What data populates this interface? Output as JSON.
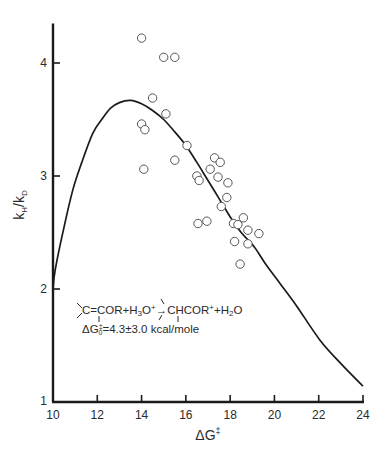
{
  "chart_data": {
    "type": "scatter",
    "title": "",
    "xlabel": "ΔG‡",
    "ylabel": "kH/kD",
    "xlim": [
      10,
      24
    ],
    "ylim": [
      1,
      4.35
    ],
    "x_ticks": [
      10,
      12,
      14,
      16,
      18,
      20,
      22,
      24
    ],
    "y_ticks": [
      1,
      2,
      3,
      4
    ],
    "grid": false,
    "legend": null,
    "annotation": {
      "line1": "C=COR+H3O+ → CHCOR+ + H2O",
      "line2": "ΔG0‡=4.3±3.0 kcal/mole"
    },
    "series": [
      {
        "name": "observed",
        "kind": "scatter",
        "marker": "open-circle",
        "points": [
          [
            14.0,
            4.22
          ],
          [
            15.0,
            4.05
          ],
          [
            15.5,
            4.05
          ],
          [
            14.5,
            3.69
          ],
          [
            15.1,
            3.55
          ],
          [
            14.0,
            3.46
          ],
          [
            14.15,
            3.41
          ],
          [
            16.05,
            3.27
          ],
          [
            15.5,
            3.14
          ],
          [
            14.1,
            3.06
          ],
          [
            17.3,
            3.16
          ],
          [
            17.55,
            3.12
          ],
          [
            17.1,
            3.06
          ],
          [
            16.5,
            3.0
          ],
          [
            16.6,
            2.96
          ],
          [
            17.45,
            2.99
          ],
          [
            17.9,
            2.94
          ],
          [
            17.85,
            2.81
          ],
          [
            17.6,
            2.73
          ],
          [
            16.55,
            2.58
          ],
          [
            16.95,
            2.6
          ],
          [
            18.15,
            2.58
          ],
          [
            18.35,
            2.57
          ],
          [
            18.6,
            2.63
          ],
          [
            18.8,
            2.52
          ],
          [
            19.3,
            2.49
          ],
          [
            18.2,
            2.42
          ],
          [
            18.8,
            2.4
          ],
          [
            18.45,
            2.22
          ]
        ]
      },
      {
        "name": "theoretical curve",
        "kind": "line",
        "points": [
          [
            10.0,
            2.0
          ],
          [
            10.1,
            2.17
          ],
          [
            10.5,
            2.55
          ],
          [
            10.9,
            2.88
          ],
          [
            11.3,
            3.12
          ],
          [
            11.8,
            3.38
          ],
          [
            12.2,
            3.5
          ],
          [
            12.6,
            3.6
          ],
          [
            13.0,
            3.65
          ],
          [
            13.5,
            3.67
          ],
          [
            14.0,
            3.64
          ],
          [
            14.5,
            3.58
          ],
          [
            15.0,
            3.5
          ],
          [
            15.5,
            3.39
          ],
          [
            16.0,
            3.27
          ],
          [
            16.5,
            3.12
          ],
          [
            17.0,
            2.96
          ],
          [
            17.5,
            2.8
          ],
          [
            18.0,
            2.64
          ],
          [
            18.5,
            2.5
          ],
          [
            19.1,
            2.37
          ],
          [
            19.6,
            2.22
          ],
          [
            20.25,
            2.05
          ],
          [
            21.0,
            1.85
          ],
          [
            22.05,
            1.55
          ],
          [
            23.0,
            1.34
          ],
          [
            24.0,
            1.14
          ]
        ]
      }
    ]
  },
  "labels": {
    "x_title_main": "ΔG",
    "x_title_sup": "‡",
    "y_title_k1": "k",
    "y_title_sub1": "H",
    "y_title_slash": "/k",
    "y_title_sub2": "D",
    "eq_line1_a": "C=COR+H",
    "eq_line1_b": "3",
    "eq_line1_c": "O",
    "eq_line1_d": "+",
    "eq_line1_arrow": "→",
    "eq_line1_e": "CHCOR",
    "eq_line1_f": "+",
    "eq_line1_g": "+H",
    "eq_line1_h": "2",
    "eq_line1_i": "O",
    "eq_line2_a": "ΔG",
    "eq_line2_sup": "‡",
    "eq_line2_sub": "0",
    "eq_line2_b": "=4.3±3.0 kcal/mole"
  }
}
